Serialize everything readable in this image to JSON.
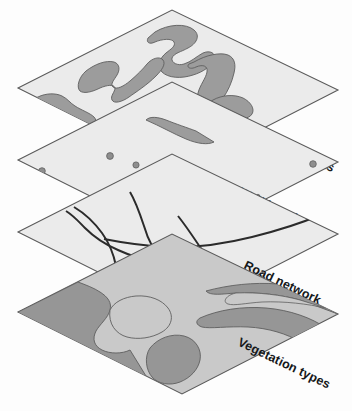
{
  "diagram": {
    "type": "isometric-layer-stack",
    "layer_count": 4,
    "background_color": "#fdfdfd"
  },
  "colors": {
    "plane_fill": "#ebebeb",
    "plane_stroke": "#5a5a5a",
    "feature_fill": "#9c9c9c",
    "feature_stroke": "#5f5f5f",
    "road_stroke": "#2b2b2b",
    "well_fill": "#8e8e8e",
    "vegetation_dark": "#969696",
    "vegetation_light": "#c9c9c9",
    "label_color": "#16181a"
  },
  "layers": [
    {
      "id": "conservation-areas",
      "label": "Conservation areas",
      "order": 1,
      "theme": "polygon",
      "feature_count": 5,
      "description": "Irregular shaded polygons representing protected conservation zones"
    },
    {
      "id": "well-locations",
      "label": "Well locations",
      "order": 2,
      "theme": "point",
      "feature_count": 10,
      "description": "Scattered point symbols marking well sites"
    },
    {
      "id": "road-network",
      "label": "Road network",
      "order": 3,
      "theme": "line",
      "feature_count": 5,
      "description": "Curved intersecting lines forming a road network"
    },
    {
      "id": "vegetation-types",
      "label": "Vegetation types",
      "order": 4,
      "theme": "polygon-classified",
      "feature_count": 6,
      "description": "Contiguous classified areas of differing vegetation cover"
    }
  ],
  "wells": [
    {
      "cx": 42,
      "cy": 171,
      "r": 3.3
    },
    {
      "cx": 110,
      "cy": 156,
      "r": 3.4
    },
    {
      "cx": 136,
      "cy": 165,
      "r": 3.1
    },
    {
      "cx": 150,
      "cy": 174,
      "r": 3.5
    },
    {
      "cx": 176,
      "cy": 187,
      "r": 3.4
    },
    {
      "cx": 225,
      "cy": 208,
      "r": 3.3
    },
    {
      "cx": 219,
      "cy": 222,
      "r": 1.9
    },
    {
      "cx": 160,
      "cy": 230,
      "r": 3.3
    },
    {
      "cx": 313,
      "cy": 164,
      "r": 3.3
    },
    {
      "cx": 258,
      "cy": 196,
      "r": 1.7
    }
  ]
}
